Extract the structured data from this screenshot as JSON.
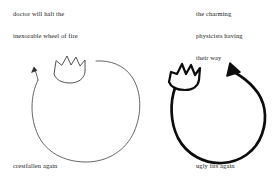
{
  "image": {
    "kind": "hand-drawn-diagram",
    "width": 279,
    "height": 183,
    "background_color": "#ffffff",
    "ink_color": "#1a1a1a"
  },
  "captions": {
    "left": [
      "doctor will halt the",
      "inexorable wheel of fire",
      "crestfallen again"
    ],
    "right": [
      "the charming",
      "physicists having",
      "their way",
      "ugly fits again"
    ]
  },
  "figures": [
    {
      "id": "left-loop",
      "label": "thin circular arrow loop with crown",
      "stroke_color": "#404040",
      "stroke_width": 0.7,
      "arrow_direction": "up-right",
      "arrow_size": "small",
      "crown_peaks": 3,
      "center_x": 88,
      "center_y": 113,
      "radius_x": 55,
      "radius_y": 52
    },
    {
      "id": "right-loop",
      "label": "thick circular arrow loop with crown",
      "stroke_color": "#0d0d0d",
      "stroke_width": 2.6,
      "arrow_direction": "up-left",
      "arrow_size": "large",
      "crown_peaks": 3,
      "center_x": 215,
      "center_y": 118,
      "radius_x": 45,
      "radius_y": 45
    }
  ]
}
